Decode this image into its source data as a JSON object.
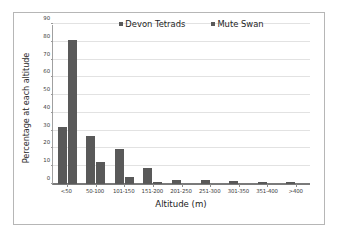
{
  "chart_data": {
    "type": "bar",
    "title": "",
    "xlabel": "Altitude (m)",
    "ylabel": "Percentage at each altitude",
    "categories": [
      "<50",
      "50-100",
      "101-150",
      "151-200",
      "201-250",
      "251-300",
      "301-350",
      "351-400",
      ">400"
    ],
    "series": [
      {
        "name": "Devon Tetrads",
        "color": "#595959",
        "values": [
          32.0,
          27.0,
          19.8,
          8.8,
          2.2,
          2.2,
          1.5,
          1.2,
          0.9
        ]
      },
      {
        "name": "Mute Swan",
        "color": "#595959",
        "values": [
          81.0,
          12.3,
          3.7,
          0.9,
          0.0,
          0.0,
          0.0,
          0.0,
          0.0
        ]
      }
    ],
    "ylim": [
      0,
      90
    ],
    "yticks": [
      0,
      10,
      20,
      30,
      40,
      50,
      60,
      70,
      80,
      90
    ],
    "ytick_labels": [
      "0",
      "10",
      "20",
      "30",
      "40",
      "50",
      "60",
      "70",
      "80",
      "90"
    ],
    "grid": true,
    "legend_position": "top-center"
  },
  "legend": {
    "items": [
      {
        "label": "Devon Tetrads"
      },
      {
        "label": "Mute Swan"
      }
    ]
  },
  "axes": {
    "x_title": "Altitude (m)",
    "y_title": "Percentage at each altitude"
  }
}
